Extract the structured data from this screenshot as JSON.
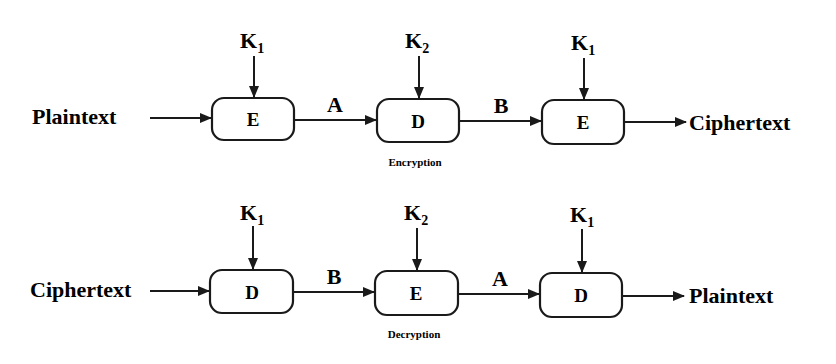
{
  "encryption": {
    "caption": "Encryption",
    "input": "Plaintext",
    "output": "Ciphertext",
    "stages": [
      {
        "op": "E",
        "key": "K",
        "key_sub": "1"
      },
      {
        "op": "D",
        "key": "K",
        "key_sub": "2"
      },
      {
        "op": "E",
        "key": "K",
        "key_sub": "1"
      }
    ],
    "links": [
      "A",
      "B"
    ]
  },
  "decryption": {
    "caption": "Decryption",
    "input": "Ciphertext",
    "output": "Plaintext",
    "stages": [
      {
        "op": "D",
        "key": "K",
        "key_sub": "1"
      },
      {
        "op": "E",
        "key": "K",
        "key_sub": "2"
      },
      {
        "op": "D",
        "key": "K",
        "key_sub": "1"
      }
    ],
    "links": [
      "B",
      "A"
    ]
  },
  "colors": {
    "stroke": "#1a1a1a",
    "background": "#ffffff"
  }
}
